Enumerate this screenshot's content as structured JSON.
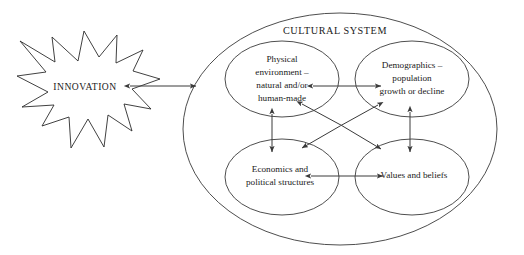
{
  "diagram": {
    "title": "CULTURAL SYSTEM",
    "source_shape": {
      "label": "INNOVATION",
      "shape": "starburst"
    },
    "container": {
      "label": "CULTURAL SYSTEM",
      "shape": "ellipse"
    },
    "nodes": [
      {
        "id": "physical-environment",
        "shape": "ellipse",
        "lines": [
          "Physical",
          "environment –",
          "natural and/or",
          "human-made"
        ]
      },
      {
        "id": "demographics",
        "shape": "ellipse",
        "lines": [
          "Demographics –",
          "population",
          "growth or decline"
        ]
      },
      {
        "id": "economics-political-structures",
        "shape": "ellipse",
        "lines": [
          "Economics and",
          "political structures"
        ]
      },
      {
        "id": "values-and-beliefs",
        "shape": "ellipse",
        "lines": [
          "Values and beliefs"
        ]
      }
    ],
    "connectors": [
      {
        "id": "innovation-to-system",
        "from": "INNOVATION",
        "to": "CULTURAL SYSTEM",
        "style": "double-arrow",
        "orientation": "horizontal"
      },
      {
        "id": "physical-to-demographics",
        "from": "Physical environment",
        "to": "Demographics",
        "style": "double-arrow",
        "orientation": "horizontal"
      },
      {
        "id": "economics-to-values",
        "from": "Economics and political structures",
        "to": "Values and beliefs",
        "style": "double-arrow",
        "orientation": "horizontal"
      },
      {
        "id": "physical-to-economics",
        "from": "Physical environment",
        "to": "Economics and political structures",
        "style": "double-arrow",
        "orientation": "vertical"
      },
      {
        "id": "demographics-to-values",
        "from": "Demographics",
        "to": "Values and beliefs",
        "style": "double-arrow",
        "orientation": "vertical"
      },
      {
        "id": "physical-to-values",
        "from": "Physical environment",
        "to": "Values and beliefs",
        "style": "double-arrow",
        "orientation": "diagonal"
      },
      {
        "id": "demographics-to-economics",
        "from": "Demographics",
        "to": "Economics and political structures",
        "style": "double-arrow",
        "orientation": "diagonal"
      }
    ],
    "colors": {
      "stroke": "#3a3a3a",
      "text": "#1a1a1a",
      "background": "#ffffff"
    }
  }
}
